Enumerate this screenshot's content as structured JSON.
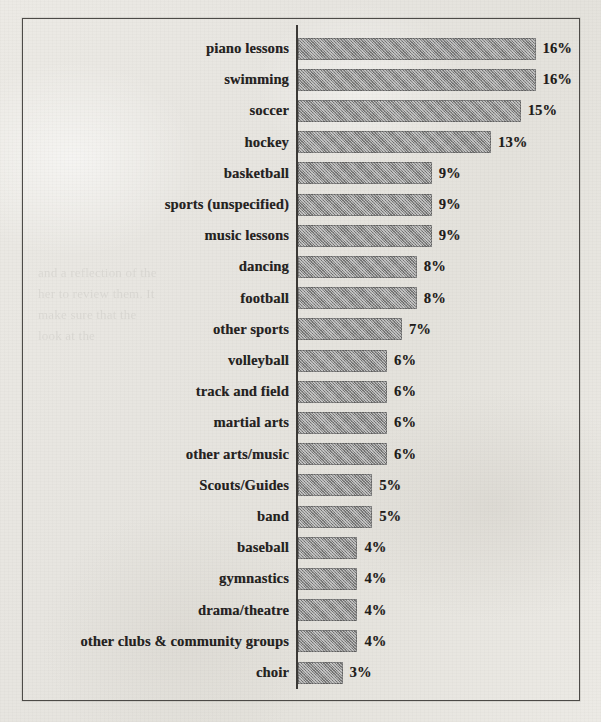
{
  "chart_data": {
    "type": "bar",
    "orientation": "horizontal",
    "title": "",
    "subtitle": "",
    "xlabel": "",
    "ylabel": "",
    "xlim": [
      0,
      16
    ],
    "grid": false,
    "legend": null,
    "value_suffix": "%",
    "categories": [
      "piano lessons",
      "swimming",
      "soccer",
      "hockey",
      "basketball",
      "sports (unspecified)",
      "music lessons",
      "dancing",
      "football",
      "other sports",
      "volleyball",
      "track and field",
      "martial arts",
      "other arts/music",
      "Scouts/Guides",
      "band",
      "baseball",
      "gymnastics",
      "drama/theatre",
      "other clubs & community groups",
      "choir"
    ],
    "values": [
      16,
      16,
      15,
      13,
      9,
      9,
      9,
      8,
      8,
      7,
      6,
      6,
      6,
      6,
      5,
      5,
      4,
      4,
      4,
      4,
      3
    ],
    "value_labels": [
      "16%",
      "16%",
      "15%",
      "13%",
      "9%",
      "9%",
      "9%",
      "8%",
      "8%",
      "7%",
      "6%",
      "6%",
      "6%",
      "6%",
      "5%",
      "5%",
      "4%",
      "4%",
      "4%",
      "4%",
      "3%"
    ]
  },
  "style": {
    "paper_color": "#e9e7e2",
    "bar_fill": "#8b8b8a",
    "axis_color": "#3b3936",
    "border_color": "#4c4a47",
    "text_color": "#24221f"
  },
  "artifacts": {
    "bleed_through_text": "and a reflection of the\nher to review them. It\nmake sure that the\nlook at the"
  }
}
